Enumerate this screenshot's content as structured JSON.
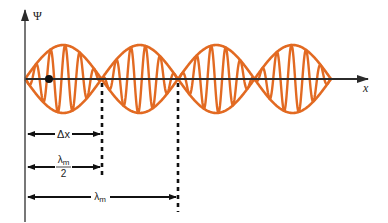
{
  "diagram": {
    "colors": {
      "wave": "#E26A22",
      "axis": "#2b2b2b",
      "annotation": "#111111",
      "background": "#ffffff"
    },
    "axes": {
      "y_label": "Ψ",
      "x_label": "x"
    },
    "wave": {
      "lobes": 4,
      "envelope_half_wavelength_px": 76.5,
      "carrier_period_px": 14.6,
      "amplitude_px": 34
    },
    "marker": {
      "name": "particle-dot"
    },
    "annotations": [
      {
        "id": "delta-x",
        "label": "Δx",
        "extent": "half-lobe"
      },
      {
        "id": "half-lambda",
        "numerator": "λm",
        "denominator": "2",
        "extent": "half-lobe"
      },
      {
        "id": "lambda-m",
        "label": "λm",
        "extent": "full-lobe-pair"
      }
    ],
    "labels": {
      "delta_x": "Δx",
      "lambda_symbol": "λ",
      "lambda_sub": "m",
      "two": "2"
    }
  }
}
